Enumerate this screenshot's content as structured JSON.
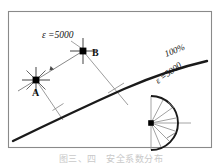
{
  "figure": {
    "background_color": "#ffffff",
    "frame": {
      "x": 8,
      "y": 11,
      "width": 204,
      "height": 137,
      "stroke": "#8a8a8a",
      "stroke_width": 1.1
    },
    "labels": {
      "epsilon_top": "ε =5000",
      "point_a": "A",
      "point_b": "B",
      "percent_curve": "100%",
      "epsilon_fan": "ε =5000"
    },
    "colors": {
      "curve": "#1a1a1a",
      "thin_line": "#7a7a7a",
      "marker": "#000000",
      "frame": "#8a8a8a",
      "text": "#111111",
      "caption": "#c9c9c9"
    },
    "main_curve": {
      "name": "100%-isoline",
      "stroke_width": 2.4,
      "path": "M 13 141 C 48 124 86 106 124 89 C 154 76 180 67 206 61"
    },
    "points": [
      {
        "name": "A",
        "x": 36,
        "y": 80,
        "marker": "star-cross",
        "label": "A",
        "label_dx": -4,
        "label_dy": 14
      },
      {
        "name": "B",
        "x": 83,
        "y": 51,
        "marker": "star-cross",
        "label": "B",
        "label_dx": 9,
        "label_dy": 4
      }
    ],
    "connector_ab": {
      "from_x": 36,
      "from_y": 80,
      "to_x": 83,
      "to_y": 51,
      "arrow_at_x": 54,
      "arrow_at_y": 69
    },
    "leader_epsilon_top": {
      "x1": 71,
      "y1": 41,
      "x2": 84,
      "y2": 50
    },
    "normals": [
      {
        "name": "normal-from-a",
        "x1": 36,
        "y1": 80,
        "x2": 63,
        "y2": 120,
        "tick_x": 58,
        "tick_y": 113
      },
      {
        "name": "normal-from-b",
        "x1": 83,
        "y1": 51,
        "x2": 127,
        "y2": 103,
        "tick_x": 116,
        "tick_y": 90
      }
    ],
    "fan": {
      "name": "strain-rose",
      "center_x": 151,
      "center_y": 123,
      "radius": 26,
      "arc_path": "M 151 97 A 26 26 0 0 1 151 149",
      "chord": {
        "x1": 151,
        "y1": 97,
        "x2": 151,
        "y2": 149
      },
      "axis": {
        "x1": 151,
        "y1": 123,
        "x2": 189,
        "y2": 123
      },
      "rays": [
        {
          "angle_deg": -62
        },
        {
          "angle_deg": -36
        },
        {
          "angle_deg": -12
        },
        {
          "angle_deg": 18
        },
        {
          "angle_deg": 44
        },
        {
          "angle_deg": 66
        }
      ],
      "ticks": [
        {
          "angle_deg": -40
        },
        {
          "angle_deg": 40
        }
      ]
    },
    "rotated_labels": [
      {
        "name": "percent-label",
        "text": "100%",
        "x": 181,
        "y": 55,
        "rotate": -22
      },
      {
        "name": "epsilon-fan-label",
        "text": "ε =5000",
        "x": 172,
        "y": 79,
        "rotate": -38
      }
    ],
    "caption_text": "图三、四　安全系数分布"
  }
}
